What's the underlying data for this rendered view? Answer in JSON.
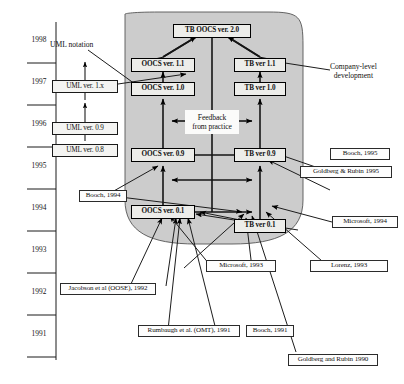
{
  "figure": {
    "kind": "timeline-evolution-diagram",
    "width": 404,
    "height": 384,
    "background": "#ffffff",
    "shaded_region_color": "#cfcfcf",
    "shaded_region_label": "company-level development area"
  },
  "timeline": {
    "axis_name": "year-axis",
    "years": [
      "1998",
      "1997",
      "1996",
      "1995",
      "1994",
      "1993",
      "1992",
      "1991"
    ]
  },
  "annotations": {
    "uml_notation": "UML notation",
    "company_level": "Company-level\ndevelopment",
    "company_level_line1": "Company-level",
    "company_level_line2": "development",
    "feedback_line1": "Feedback",
    "feedback_line2": "from practice"
  },
  "uml_versions": [
    {
      "id": "uml-1x",
      "label": "UML ver. 1.x"
    },
    {
      "id": "uml-09",
      "label": "UML ver. 0.9"
    },
    {
      "id": "uml-08",
      "label": "UML ver. 0.8"
    }
  ],
  "oocs_versions": [
    {
      "id": "oocs-11",
      "label": "OOCS ver. 1.1"
    },
    {
      "id": "oocs-10",
      "label": "OOCS ver. 1.0"
    },
    {
      "id": "oocs-09",
      "label": "OOCS ver. 0.9"
    },
    {
      "id": "oocs-01",
      "label": "OOCS ver. 0.1"
    }
  ],
  "tb_versions": [
    {
      "id": "tb-11",
      "label": "TB ver 1.1"
    },
    {
      "id": "tb-10",
      "label": "TB ver 1.0"
    },
    {
      "id": "tb-09",
      "label": "TB ver 0.9"
    },
    {
      "id": "tb-01",
      "label": "TB ver 0.1"
    }
  ],
  "merged_version": {
    "id": "tb-oocs-20",
    "label": "TB OOCS ver. 2.0"
  },
  "references": [
    {
      "id": "ref-booch-1995",
      "label": "Booch, 1995"
    },
    {
      "id": "ref-goldberg-rubin-1995",
      "label": "Goldberg & Rubin 1995"
    },
    {
      "id": "ref-booch-1994",
      "label": "Booch, 1994"
    },
    {
      "id": "ref-microsoft-1994",
      "label": "Microsoft, 1994"
    },
    {
      "id": "ref-microsoft-1993",
      "label": "Microsoft, 1993"
    },
    {
      "id": "ref-lorenz-1993",
      "label": "Lorenz, 1993"
    },
    {
      "id": "ref-jacobson-1992",
      "label": "Jacobson et al (OOSE), 1992"
    },
    {
      "id": "ref-rumbaugh-1991",
      "label": "Rumbaugh et al. (OMT), 1991"
    },
    {
      "id": "ref-booch-1991",
      "label": "Booch, 1991"
    },
    {
      "id": "ref-goldberg-rubin-1990",
      "label": "Goldberg and Rubin 1990"
    }
  ]
}
